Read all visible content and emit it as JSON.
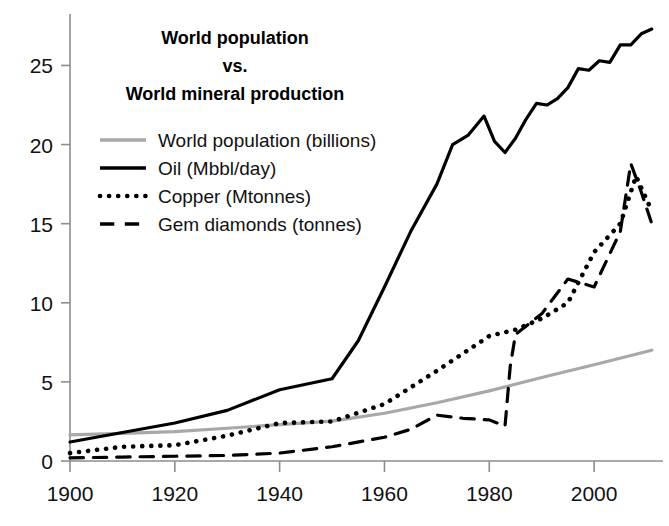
{
  "title": {
    "line1": "World population",
    "line2": "vs.",
    "line3": "World mineral production"
  },
  "colors": {
    "population": "#a8a8a8",
    "oil": "#000000",
    "copper": "#000000",
    "diamonds": "#000000",
    "axis": "#8d8d8d",
    "text": "#111111",
    "background": "#ffffff"
  },
  "legend": {
    "items": [
      {
        "label": "World population (billions)",
        "style": "solid",
        "color": "#a8a8a8",
        "width": 3.4
      },
      {
        "label": "Oil (Mbbl/day)",
        "style": "solid",
        "color": "#000000",
        "width": 3.4
      },
      {
        "label": "Copper (Mtonnes)",
        "style": "dotted",
        "color": "#000000",
        "width": 4.6
      },
      {
        "label": "Gem diamonds (tonnes)",
        "style": "dashed",
        "color": "#000000",
        "width": 3.4
      }
    ]
  },
  "chart_data": {
    "type": "line",
    "title": "World population vs. World mineral production",
    "xlabel": "",
    "ylabel": "",
    "xlim": [
      1900,
      2012
    ],
    "ylim": [
      0,
      28
    ],
    "grid": false,
    "legend_position": "upper-left-inside",
    "xticks": [
      1900,
      1920,
      1940,
      1960,
      1980,
      2000
    ],
    "yticks": [
      0,
      5,
      10,
      15,
      20,
      25
    ],
    "series": [
      {
        "name": "World population (billions)",
        "unit": "billions",
        "style": "solid",
        "color": "#a8a8a8",
        "x": [
          1900,
          1910,
          1920,
          1930,
          1940,
          1950,
          1960,
          1970,
          1980,
          1990,
          2000,
          2011
        ],
        "values": [
          1.65,
          1.75,
          1.86,
          2.07,
          2.3,
          2.52,
          3.02,
          3.68,
          4.43,
          5.28,
          6.08,
          7.0
        ]
      },
      {
        "name": "Oil (Mbbl/day)",
        "unit": "Mbbl/day",
        "style": "solid",
        "color": "#000000",
        "x": [
          1900,
          1910,
          1920,
          1930,
          1940,
          1950,
          1955,
          1960,
          1965,
          1970,
          1973,
          1976,
          1979,
          1981,
          1983,
          1985,
          1987,
          1989,
          1991,
          1993,
          1995,
          1997,
          1999,
          2001,
          2003,
          2005,
          2007,
          2009,
          2011
        ],
        "values": [
          1.2,
          1.8,
          2.4,
          3.2,
          4.5,
          5.2,
          7.6,
          11.0,
          14.5,
          17.5,
          20.0,
          20.6,
          21.8,
          20.2,
          19.5,
          20.4,
          21.6,
          22.6,
          22.5,
          22.9,
          23.6,
          24.8,
          24.7,
          25.3,
          25.2,
          26.3,
          26.3,
          27.0,
          27.3
        ]
      },
      {
        "name": "Copper (Mtonnes)",
        "unit": "Mtonnes",
        "style": "dotted",
        "color": "#000000",
        "x": [
          1900,
          1910,
          1920,
          1930,
          1940,
          1950,
          1960,
          1970,
          1980,
          1985,
          1990,
          1995,
          2000,
          2005,
          2008,
          2011
        ],
        "values": [
          0.5,
          0.9,
          1.0,
          1.6,
          2.4,
          2.5,
          3.6,
          5.7,
          7.9,
          8.3,
          9.0,
          10.0,
          13.2,
          15.0,
          18.0,
          15.8
        ]
      },
      {
        "name": "Gem diamonds (tonnes)",
        "unit": "tonnes",
        "style": "dashed",
        "color": "#000000",
        "x": [
          1900,
          1910,
          1920,
          1930,
          1940,
          1950,
          1960,
          1965,
          1970,
          1975,
          1980,
          1983,
          1984,
          1985,
          1990,
          1995,
          2000,
          2005,
          2007,
          2009,
          2011
        ],
        "values": [
          0.2,
          0.25,
          0.3,
          0.35,
          0.5,
          0.9,
          1.5,
          2.0,
          2.9,
          2.7,
          2.6,
          2.2,
          6.0,
          8.0,
          9.3,
          11.5,
          11.0,
          14.5,
          18.8,
          17.0,
          15.0
        ]
      }
    ]
  }
}
